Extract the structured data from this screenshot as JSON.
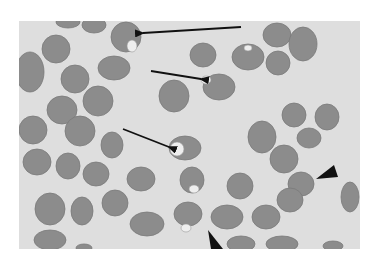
{
  "figure": {
    "colors": {
      "page_background": "#ffffff",
      "field_background": "#dedede",
      "cell_fill": "#8c8c8c",
      "cell_edge": "#7a7a7a",
      "vacuole_fill": "#eeeeee",
      "arrow": "#111111"
    },
    "frame": {
      "x": 19,
      "y": 21,
      "width": 341,
      "height": 228
    },
    "cells": [
      {
        "cx": 30,
        "cy": 72,
        "rx": 14,
        "ry": 20
      },
      {
        "cx": 68,
        "cy": 22,
        "rx": 12,
        "ry": 6
      },
      {
        "cx": 94,
        "cy": 25,
        "rx": 12,
        "ry": 8
      },
      {
        "cx": 126,
        "cy": 37,
        "rx": 15,
        "ry": 15
      },
      {
        "cx": 56,
        "cy": 49,
        "rx": 14,
        "ry": 14
      },
      {
        "cx": 114,
        "cy": 68,
        "rx": 16,
        "ry": 12
      },
      {
        "cx": 75,
        "cy": 79,
        "rx": 14,
        "ry": 14
      },
      {
        "cx": 98,
        "cy": 101,
        "rx": 15,
        "ry": 15
      },
      {
        "cx": 62,
        "cy": 110,
        "rx": 15,
        "ry": 14
      },
      {
        "cx": 33,
        "cy": 130,
        "rx": 14,
        "ry": 14
      },
      {
        "cx": 80,
        "cy": 131,
        "rx": 15,
        "ry": 15
      },
      {
        "cx": 112,
        "cy": 145,
        "rx": 11,
        "ry": 13
      },
      {
        "cx": 37,
        "cy": 162,
        "rx": 14,
        "ry": 13
      },
      {
        "cx": 68,
        "cy": 166,
        "rx": 12,
        "ry": 13
      },
      {
        "cx": 96,
        "cy": 174,
        "rx": 13,
        "ry": 12
      },
      {
        "cx": 141,
        "cy": 179,
        "rx": 14,
        "ry": 12
      },
      {
        "cx": 50,
        "cy": 209,
        "rx": 15,
        "ry": 16
      },
      {
        "cx": 82,
        "cy": 211,
        "rx": 11,
        "ry": 14
      },
      {
        "cx": 115,
        "cy": 203,
        "rx": 13,
        "ry": 13
      },
      {
        "cx": 147,
        "cy": 224,
        "rx": 17,
        "ry": 12
      },
      {
        "cx": 50,
        "cy": 240,
        "rx": 16,
        "ry": 10
      },
      {
        "cx": 84,
        "cy": 248,
        "rx": 8,
        "ry": 4
      },
      {
        "cx": 174,
        "cy": 96,
        "rx": 15,
        "ry": 16
      },
      {
        "cx": 185,
        "cy": 148,
        "rx": 16,
        "ry": 12
      },
      {
        "cx": 192,
        "cy": 180,
        "rx": 12,
        "ry": 13
      },
      {
        "cx": 188,
        "cy": 214,
        "rx": 14,
        "ry": 12
      },
      {
        "cx": 203,
        "cy": 55,
        "rx": 13,
        "ry": 12
      },
      {
        "cx": 219,
        "cy": 87,
        "rx": 16,
        "ry": 13
      },
      {
        "cx": 248,
        "cy": 57,
        "rx": 16,
        "ry": 13
      },
      {
        "cx": 277,
        "cy": 35,
        "rx": 14,
        "ry": 12
      },
      {
        "cx": 303,
        "cy": 44,
        "rx": 14,
        "ry": 17
      },
      {
        "cx": 278,
        "cy": 63,
        "rx": 12,
        "ry": 12
      },
      {
        "cx": 262,
        "cy": 137,
        "rx": 14,
        "ry": 16
      },
      {
        "cx": 294,
        "cy": 115,
        "rx": 12,
        "ry": 12
      },
      {
        "cx": 327,
        "cy": 117,
        "rx": 12,
        "ry": 13
      },
      {
        "cx": 309,
        "cy": 138,
        "rx": 12,
        "ry": 10
      },
      {
        "cx": 240,
        "cy": 186,
        "rx": 13,
        "ry": 13
      },
      {
        "cx": 284,
        "cy": 159,
        "rx": 14,
        "ry": 14
      },
      {
        "cx": 301,
        "cy": 184,
        "rx": 13,
        "ry": 12
      },
      {
        "cx": 290,
        "cy": 200,
        "rx": 13,
        "ry": 12
      },
      {
        "cx": 350,
        "cy": 197,
        "rx": 9,
        "ry": 15
      },
      {
        "cx": 227,
        "cy": 217,
        "rx": 16,
        "ry": 12
      },
      {
        "cx": 266,
        "cy": 217,
        "rx": 14,
        "ry": 12
      },
      {
        "cx": 241,
        "cy": 244,
        "rx": 14,
        "ry": 8
      },
      {
        "cx": 282,
        "cy": 244,
        "rx": 16,
        "ry": 8
      },
      {
        "cx": 333,
        "cy": 246,
        "rx": 10,
        "ry": 5
      }
    ],
    "vacuoles": [
      {
        "cx": 132,
        "cy": 46,
        "rx": 5,
        "ry": 6
      },
      {
        "cx": 206,
        "cy": 80,
        "rx": 5,
        "ry": 4
      },
      {
        "cx": 248,
        "cy": 48,
        "rx": 4,
        "ry": 3
      },
      {
        "cx": 177,
        "cy": 149,
        "rx": 7,
        "ry": 7
      },
      {
        "cx": 194,
        "cy": 189,
        "rx": 5,
        "ry": 4
      },
      {
        "cx": 186,
        "cy": 228,
        "rx": 5,
        "ry": 4
      }
    ],
    "arrows": [
      {
        "name": "arrow-top",
        "x1": 241,
        "y1": 27,
        "x2": 143,
        "y2": 33
      },
      {
        "name": "arrow-upper-middle",
        "x1": 151,
        "y1": 71,
        "x2": 201,
        "y2": 79
      },
      {
        "name": "arrow-middle",
        "x1": 123,
        "y1": 129,
        "x2": 169,
        "y2": 147
      }
    ],
    "arrowheads": [
      {
        "name": "arrowhead-right",
        "points": "316,179 334,165 338,177"
      },
      {
        "name": "arrowhead-bottom",
        "points": "208,230 211,249 223,249"
      }
    ]
  }
}
